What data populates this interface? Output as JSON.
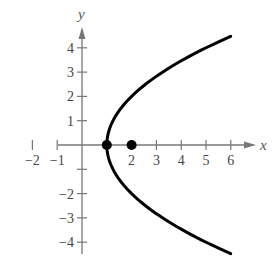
{
  "chart_data": {
    "type": "line",
    "title": "",
    "xlabel": "x",
    "ylabel": "y",
    "xlim": [
      -2,
      6
    ],
    "ylim": [
      -4,
      4
    ],
    "grid": false,
    "x_ticks": [
      -2,
      -1,
      1,
      2,
      3,
      4,
      5,
      6
    ],
    "x_tick_labels": [
      "−2",
      "−1",
      "",
      "2",
      "3",
      "4",
      "5",
      "6"
    ],
    "y_ticks": [
      -4,
      -3,
      -2,
      -1,
      1,
      2,
      3,
      4
    ],
    "y_tick_labels": [
      "−4",
      "−3",
      "−2",
      "",
      "1",
      "2",
      "3",
      "4"
    ],
    "series": [
      {
        "name": "parabola y^2 = 4(x - 1)",
        "equation": "y^2 = 4(x - 1)",
        "x_range": [
          1,
          6
        ],
        "y_range": [
          -4.47,
          4.47
        ],
        "color": "#000000"
      }
    ],
    "points": [
      {
        "label": "vertex",
        "x": 1,
        "y": 0
      },
      {
        "label": "focus",
        "x": 2,
        "y": 0
      }
    ]
  },
  "style": {
    "axis_color": "#777777",
    "curve_color": "#000000",
    "point_color": "#000000"
  }
}
